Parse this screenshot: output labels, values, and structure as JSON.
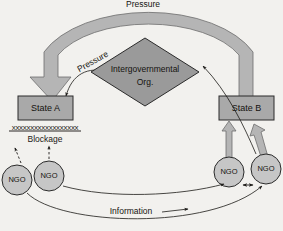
{
  "diagram": {
    "background_color": "#f2f1ee",
    "nodes": {
      "state_a": {
        "label": "State A",
        "shape": "rectangle",
        "fill": "#a9a9a9",
        "stroke": "#2b2b2b"
      },
      "state_b": {
        "label": "State B",
        "shape": "rectangle",
        "fill": "#a9a9a9",
        "stroke": "#2b2b2b"
      },
      "igo": {
        "label_line1": "Intergovernmental",
        "label_line2": "Org.",
        "shape": "diamond",
        "fill": "#9a9a9a",
        "stroke": "#2b2b2b"
      },
      "ngo_a1": {
        "label": "NGO",
        "shape": "circle",
        "fill": "#c6c6c6",
        "stroke": "#2b2b2b"
      },
      "ngo_a2": {
        "label": "NGO",
        "shape": "circle",
        "fill": "#c6c6c6",
        "stroke": "#2b2b2b"
      },
      "ngo_b1": {
        "label": "NGO",
        "shape": "circle",
        "fill": "#c6c6c6",
        "stroke": "#2b2b2b"
      },
      "ngo_b2": {
        "label": "NGO",
        "shape": "circle",
        "fill": "#c6c6c6",
        "stroke": "#2b2b2b"
      }
    },
    "edges": {
      "pressure_arc": {
        "label": "Pressure",
        "style": "thick-gray-band-arrow",
        "fill": "#b5b5b5",
        "from": "state_b",
        "to": "state_a"
      },
      "pressure_igo": {
        "label": "Pressure",
        "style": "thin-curved-arrow",
        "from": "igo",
        "to": "state_a"
      },
      "information": {
        "label": "Information",
        "style": "thin-curved-arrow",
        "from": "ngo_a",
        "to": "ngo_b"
      },
      "ngo_to_state_b_1": {
        "label": "",
        "style": "thick-block-arrow",
        "fill": "#b5b5b5",
        "from": "ngo_b1",
        "to": "state_b"
      },
      "ngo_to_state_b_2": {
        "label": "",
        "style": "thick-block-arrow",
        "fill": "#b5b5b5",
        "from": "ngo_b2",
        "to": "state_b"
      },
      "ngo_to_igo": {
        "label": "",
        "style": "thin-curved-arrow",
        "from": "ngo_b2",
        "to": "igo"
      },
      "ngo_exchange": {
        "label": "",
        "style": "double-headed-arrow",
        "from": "ngo_b1",
        "to": "ngo_b2"
      }
    },
    "annotations": {
      "blockage_label": "Blockage",
      "blockage_marks": "xxxxxxxxxxxxxxxxxx"
    }
  }
}
